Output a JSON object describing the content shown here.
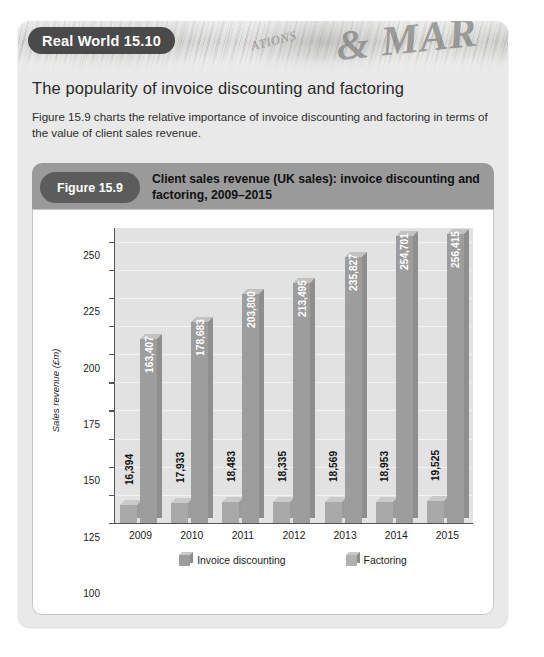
{
  "card": {
    "badge_label": "Real World 15.10",
    "heading": "The popularity of invoice discounting and factoring",
    "body": "Figure 15.9 charts the relative importance of invoice discounting and factoring in terms of the value of client sales revenue.",
    "newspaper_wordmark": "& MAR",
    "newspaper_wordmark_small": "ATIONS",
    "badge_bg": "#4a4a4a",
    "card_bg": "#e9e9e9"
  },
  "figure": {
    "pill_label": "Figure 15.9",
    "title": "Client sales revenue (UK sales): invoice discounting and factoring, 2009–2015",
    "caption_bar_bg": "#9a9a9a",
    "pill_bg": "#5c5c5c"
  },
  "chart_data": {
    "type": "bar",
    "title": "Client sales revenue (UK sales): invoice discounting and factoring, 2009–2015",
    "xlabel": "",
    "ylabel": "Sales revenue (£m)",
    "categories": [
      "2009",
      "2010",
      "2011",
      "2012",
      "2013",
      "2014",
      "2015"
    ],
    "ylim": [
      0,
      262
    ],
    "yticks": [
      0,
      25,
      50,
      75,
      100,
      125,
      150,
      175,
      200,
      225,
      250
    ],
    "ytick_labels": [
      "0",
      "25",
      "50",
      "75",
      "100",
      "125",
      "150",
      "175",
      "200",
      "225",
      "250"
    ],
    "grid": true,
    "legend_position": "bottom",
    "value_scale_note": "bar data labels are printed in thousands (£000); axis is £m",
    "series": [
      {
        "name": "Factoring",
        "color": "#a9a9a9",
        "values": [
          16.394,
          17.933,
          18.483,
          18.335,
          18.569,
          18.953,
          19.525
        ],
        "labels": [
          "16,394",
          "17,933",
          "18,483",
          "18,335",
          "18,569",
          "18,953",
          "19,525"
        ],
        "label_placement": "outside"
      },
      {
        "name": "Invoice discounting",
        "color": "#9d9d9d",
        "values": [
          163.407,
          178.683,
          203.8,
          213.495,
          235.827,
          254.701,
          256.415
        ],
        "labels": [
          "163,407",
          "178,683",
          "203,800",
          "213,495",
          "235,827",
          "254,701",
          "256,415"
        ],
        "label_placement": "inside"
      }
    ],
    "legend": [
      {
        "label": "Invoice discounting",
        "color": "#9d9d9d"
      },
      {
        "label": "Factoring",
        "color": "#b0b0b0"
      }
    ]
  }
}
